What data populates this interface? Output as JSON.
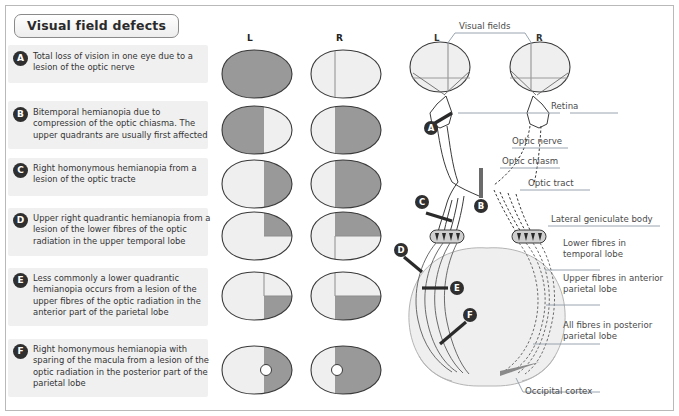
{
  "title": "Visual field defects",
  "columns": {
    "left_label": "L",
    "right_label": "R"
  },
  "colors": {
    "defect_fill": "#999999",
    "normal_fill": "#efefef",
    "band_bg": "#f0f0f0",
    "badge_bg": "#2f2f2f",
    "outline": "#3a3a3a",
    "brain_fill": "#efefef",
    "label_line": "#9aa7b4"
  },
  "rows": [
    {
      "letter": "A",
      "text": "Total loss of vision in one eye due to a lesion of the optic nerve",
      "left_eye": "all-dark",
      "right_eye": "normal"
    },
    {
      "letter": "B",
      "text": "Bitemporal hemianopia due to compression of the optic chiasma. The upper quadrants are usually first affected",
      "left_eye": "left-half-dark",
      "right_eye": "right-half-dark"
    },
    {
      "letter": "C",
      "text": "Right homonymous hemianopia from a lesion of the optic tracte",
      "left_eye": "right-half-dark",
      "right_eye": "right-half-dark"
    },
    {
      "letter": "D",
      "text": "Upper right quadrantic hemianopia from a lesion of the lower fibres of the optic radiation in the upper temporal lobe",
      "left_eye": "upper-right-dark",
      "right_eye": "upper-right-dark"
    },
    {
      "letter": "E",
      "text": "Less commonly a lower quadrantic hemianopia occurs from a lesion of the upper fibres of the optic radiation in the anterior part of the parietal lobe",
      "left_eye": "lower-right-dark",
      "right_eye": "lower-right-dark"
    },
    {
      "letter": "F",
      "text": "Right homonymous hemianopia with sparing of the macula from a lesion of the optic radiation in the posterior part of the parietal lobe",
      "left_eye": "right-half-dark-macula",
      "right_eye": "right-half-dark-macula"
    }
  ],
  "anatomy": {
    "visual_fields_label": "Visual fields",
    "left_field_label": "L",
    "right_field_label": "R",
    "labels": [
      {
        "id": "retina",
        "text": "Retina"
      },
      {
        "id": "optic-nerve",
        "text": "Optic nerve"
      },
      {
        "id": "optic-chiasm",
        "text": "Optic chiasm"
      },
      {
        "id": "optic-tract",
        "text": "Optic tract"
      },
      {
        "id": "lateral-geniculate-body",
        "text": "Lateral geniculate body"
      },
      {
        "id": "lower-fibres-temporal-lobe",
        "line1": "Lower fibres in",
        "line2": "temporal lobe"
      },
      {
        "id": "upper-fibres-anterior-parietal-lobe",
        "line1": "Upper fibres in anterior",
        "line2": "parietal lobe"
      },
      {
        "id": "all-fibres-posterior-parietal-lobe",
        "line1": "All fibres in posterior",
        "line2": "parietal lobe"
      },
      {
        "id": "occipital-cortex",
        "text": "Occipital cortex"
      }
    ],
    "lesion_markers": [
      "A",
      "B",
      "C",
      "D",
      "E",
      "F"
    ]
  }
}
